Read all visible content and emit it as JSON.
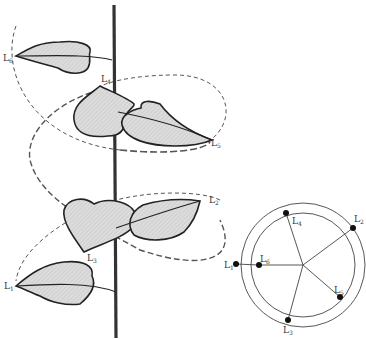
{
  "figure": {
    "stem_labels": [
      {
        "id": "L1",
        "text": "L",
        "sub": "1"
      },
      {
        "id": "L2",
        "text": "L",
        "sub": "2"
      },
      {
        "id": "L3",
        "text": "L",
        "sub": "3"
      },
      {
        "id": "L4",
        "text": "L",
        "sub": "4"
      },
      {
        "id": "L5",
        "text": "L",
        "sub": "5"
      },
      {
        "id": "L6",
        "text": "L",
        "sub": "6"
      }
    ],
    "diagram_labels": [
      {
        "id": "L1",
        "text": "L",
        "sub": "1"
      },
      {
        "id": "L2",
        "text": "L",
        "sub": "2"
      },
      {
        "id": "L3",
        "text": "L",
        "sub": "3"
      },
      {
        "id": "L4",
        "text": "L",
        "sub": "4"
      },
      {
        "id": "L5",
        "text": "L",
        "sub": "5"
      },
      {
        "id": "L6",
        "text": "L",
        "sub": "6"
      }
    ]
  },
  "colors": {
    "line": "#2a2a2a",
    "leaf_fill": "#d9d9d9",
    "dash": "#555555"
  }
}
